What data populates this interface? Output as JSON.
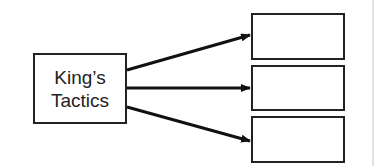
{
  "diagram": {
    "source": {
      "line1": "King’s",
      "line2": "Tactics"
    },
    "targets": [
      {
        "label": ""
      },
      {
        "label": ""
      },
      {
        "label": ""
      }
    ],
    "colors": {
      "stroke": "#222222",
      "background": "#ffffff"
    }
  }
}
